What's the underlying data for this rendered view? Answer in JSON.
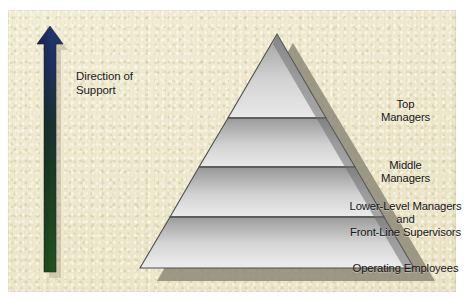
{
  "figure": {
    "background_color": "#efe9cd",
    "panel_border_color": "#dcd5b4"
  },
  "arrow": {
    "name": "direction-of-support-arrow",
    "label_line1": "Direction of",
    "label_line2": "Support",
    "points": "up",
    "gradient_top_color": "#1e2f64",
    "gradient_mid_color": "#16352f",
    "gradient_bottom_color": "#1d4a1c",
    "shadow_color": "#b9b49a"
  },
  "pyramid": {
    "name": "management-level-pyramid",
    "outline_color": "#4b4b4b",
    "shadow_color": "#8e8a78",
    "divider_color": "#5a5a5a",
    "tiers": [
      {
        "id": "top-managers",
        "lines": [
          "Top",
          "Managers"
        ],
        "fill_top": "#9d9d9d",
        "fill_bottom": "#e7e7e7"
      },
      {
        "id": "middle-managers",
        "lines": [
          "Middle",
          "Managers"
        ],
        "fill_top": "#9a9a9a",
        "fill_bottom": "#e9e9e9"
      },
      {
        "id": "lower-level-managers",
        "lines": [
          "Lower-Level Managers",
          "and",
          "Front-Line Supervisors"
        ],
        "fill_top": "#989898",
        "fill_bottom": "#ebebeb"
      },
      {
        "id": "operating-employees",
        "lines": [
          "Operating Employees"
        ],
        "fill_top": "#9a9a9a",
        "fill_bottom": "#ececec"
      }
    ]
  }
}
